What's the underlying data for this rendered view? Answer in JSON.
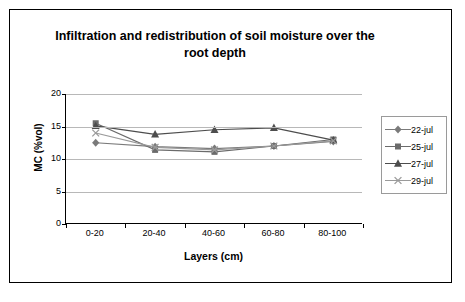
{
  "chart_data": {
    "type": "line",
    "title": "Infiltration and redistribution of soil moisture over the root depth",
    "xlabel": "Layers (cm)",
    "ylabel": "MC (%vol)",
    "categories": [
      "0-20",
      "20-40",
      "40-60",
      "60-80",
      "80-100"
    ],
    "ylim": [
      0,
      20
    ],
    "yticks": [
      "0",
      "5",
      "10",
      "15",
      "20"
    ],
    "grid": true,
    "legend_position": "right",
    "series": [
      {
        "name": "22-jul",
        "marker": "diamond",
        "color": "#7a7a7a",
        "values": [
          12.5,
          11.9,
          11.6,
          12.0,
          12.7
        ]
      },
      {
        "name": "25-jul",
        "marker": "square",
        "color": "#6b6b6b",
        "values": [
          15.5,
          11.4,
          11.1,
          12.0,
          13.0
        ]
      },
      {
        "name": "27-jul",
        "marker": "triangle",
        "color": "#4d4d4d",
        "values": [
          15.1,
          13.8,
          14.5,
          14.8,
          12.9
        ]
      },
      {
        "name": "29-jul",
        "marker": "cross",
        "color": "#9a9a9a",
        "values": [
          14.0,
          11.8,
          11.4,
          12.0,
          12.8
        ]
      }
    ]
  }
}
